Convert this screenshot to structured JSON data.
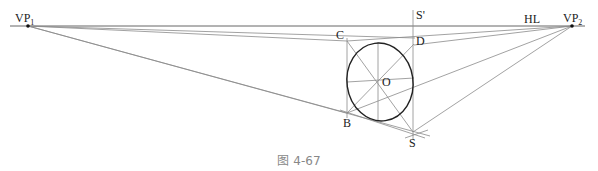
{
  "diagram": {
    "labels": {
      "vp1": "VP",
      "vp1_sub": "1",
      "vp2": "VP",
      "vp2_sub": "2",
      "hl": "HL",
      "c": "C",
      "d": "D",
      "o": "O",
      "b": "B",
      "s": "S",
      "s_prime": "S'"
    },
    "colors": {
      "lines": "#8a8a8a",
      "ellipse": "#222222",
      "caption": "#888888"
    }
  },
  "caption": "图 4-67"
}
